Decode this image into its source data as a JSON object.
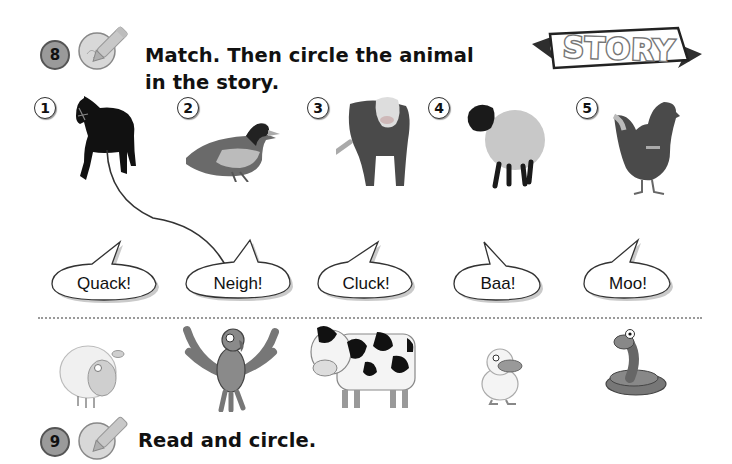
{
  "exercise8": {
    "number": "8",
    "icon": "pencil-write-icon",
    "instruction_line1": "Match. Then circle the animal",
    "instruction_line2": "in the story."
  },
  "story_banner": {
    "label": "STORY"
  },
  "photo_animals": [
    {
      "number": "1",
      "animal": "horse"
    },
    {
      "number": "2",
      "animal": "duck"
    },
    {
      "number": "3",
      "animal": "cow"
    },
    {
      "number": "4",
      "animal": "sheep"
    },
    {
      "number": "5",
      "animal": "hen"
    }
  ],
  "speech_bubbles": [
    {
      "text": "Quack!"
    },
    {
      "text": "Neigh!"
    },
    {
      "text": "Cluck!"
    },
    {
      "text": "Baa!"
    },
    {
      "text": "Moo!"
    }
  ],
  "match_line": {
    "from": "1",
    "to": "Neigh!"
  },
  "story_animals": [
    {
      "animal": "sheep"
    },
    {
      "animal": "parrot"
    },
    {
      "animal": "cow"
    },
    {
      "animal": "duckling"
    },
    {
      "animal": "snake"
    }
  ],
  "exercise9": {
    "number": "9",
    "icon": "pencil-write-icon",
    "instruction": "Read and circle."
  },
  "colors": {
    "ink": "#111111",
    "badge_gray": "#9a9a9a",
    "dots": "#9a9a9a"
  }
}
